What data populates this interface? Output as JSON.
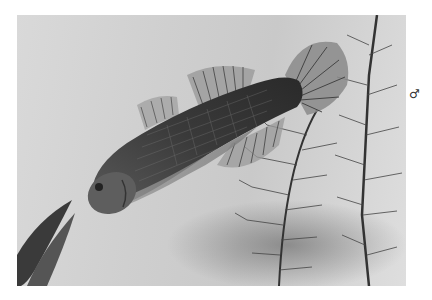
{
  "page": {
    "caption_clipped": "",
    "sex_symbol": "♂"
  },
  "photo": {
    "subject": "fish",
    "description": "Black-and-white photograph of a male fish swimming diagonally among feathery aquatic plants",
    "colors": {
      "background": "#d2d2d2",
      "fish_body": "#4a4a4a",
      "fins": "#8a8a8a",
      "plant": "#3a3a3a"
    }
  }
}
